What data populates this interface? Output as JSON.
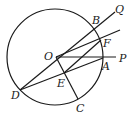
{
  "diagram": {
    "type": "geometry",
    "circle": {
      "center": "O",
      "cx": 55,
      "cy": 57,
      "r": 48
    },
    "points": {
      "O": {
        "x": 56,
        "y": 57,
        "label": "O"
      },
      "B": {
        "x": 96,
        "y": 30,
        "label": "B"
      },
      "Q": {
        "x": 115,
        "y": 12,
        "label": "Q"
      },
      "F": {
        "x": 101,
        "y": 40,
        "label": "F"
      },
      "A": {
        "x": 103,
        "y": 58,
        "label": "A"
      },
      "P": {
        "x": 117,
        "y": 58,
        "label": "P"
      },
      "D": {
        "x": 20,
        "y": 90,
        "label": "D"
      },
      "E": {
        "x": 64,
        "y": 73,
        "label": "E"
      },
      "C": {
        "x": 78,
        "y": 99,
        "label": "C"
      }
    },
    "segments": [
      [
        "D",
        "Q"
      ],
      [
        "D",
        "A"
      ],
      [
        "O",
        "P"
      ],
      [
        "O",
        "F-ext"
      ],
      [
        "O",
        "C"
      ],
      [
        "E",
        "F"
      ]
    ]
  }
}
